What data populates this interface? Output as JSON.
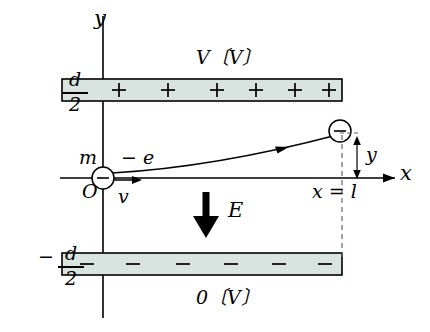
{
  "figure": {
    "title_top_plate_voltage": "V〔V〕",
    "title_bottom_plate_voltage": "0〔V〕",
    "axis_y_label": "y",
    "axis_x_label": "x",
    "origin_label": "O",
    "top_plate_offset": "d",
    "top_plate_offset_den": "2",
    "bottom_plate_offset_minus": "−",
    "bottom_plate_offset": "d",
    "bottom_plate_offset_den": "2",
    "particle_mass_label": "m",
    "particle_charge_label": "− e",
    "initial_velocity_label": "v",
    "field_label": "E",
    "deflection_label": "y",
    "plate_length_label": "x = l",
    "charge_glyph_start": "−",
    "charge_glyph_end": "−",
    "top_plate_charges": [
      "+",
      "+",
      "+",
      "+",
      "+",
      "+"
    ],
    "bottom_plate_charges": [
      "−",
      "−",
      "−",
      "−",
      "−",
      "−"
    ]
  },
  "colors": {
    "plate_fill": "#d9e4e0",
    "stroke": "#000000",
    "dashed": "#666666"
  }
}
